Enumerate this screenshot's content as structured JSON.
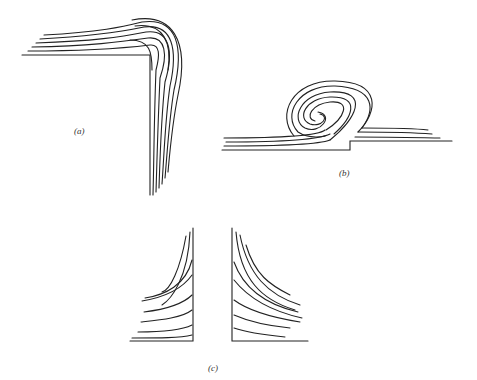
{
  "figure": {
    "panels": [
      {
        "id": "a",
        "label": "(a)",
        "description": "Layers bending over a right-angle corner"
      },
      {
        "id": "b",
        "label": "(b)",
        "description": "Layers rolled into a spiral over a step"
      },
      {
        "id": "c",
        "label": "(c)",
        "description": "Layers curving toward two vertical walls"
      }
    ],
    "colors": {
      "line": "#222222",
      "background": "#ffffff"
    }
  }
}
